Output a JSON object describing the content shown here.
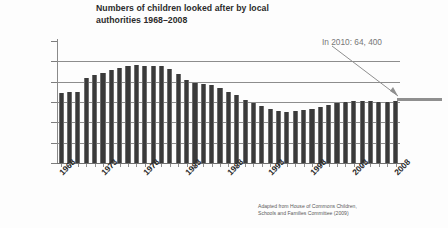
{
  "chart_data": {
    "type": "bar",
    "title": "Numbers of children looked after by local\nauthorities 1968–2008",
    "xlabel": "",
    "ylabel": "",
    "ylim": [
      0,
      120000
    ],
    "ytick_labels": [
      "120000",
      "100000",
      "80000",
      "60000",
      "40000",
      "20000",
      "0"
    ],
    "ytick_values": [
      120000,
      100000,
      80000,
      60000,
      40000,
      20000,
      0
    ],
    "grid": true,
    "legend": null,
    "x": [
      1968,
      1969,
      1970,
      1971,
      1972,
      1973,
      1974,
      1975,
      1976,
      1977,
      1978,
      1979,
      1980,
      1981,
      1982,
      1983,
      1984,
      1985,
      1986,
      1987,
      1988,
      1989,
      1990,
      1991,
      1992,
      1993,
      1994,
      1995,
      1996,
      1997,
      1998,
      1999,
      2000,
      2001,
      2002,
      2003,
      2004,
      2005,
      2006,
      2007,
      2008
    ],
    "xtick_labels": [
      "1968",
      "1973",
      "1978",
      "1983",
      "1988",
      "1993",
      "1998",
      "2003",
      "2008"
    ],
    "xtick_positions": [
      1968,
      1973,
      1978,
      1983,
      1988,
      1993,
      1998,
      2003,
      2008
    ],
    "values": [
      69000,
      69500,
      70000,
      84000,
      87000,
      89000,
      91000,
      93000,
      95500,
      96000,
      95500,
      95000,
      95000,
      92500,
      88000,
      82000,
      79000,
      77500,
      76500,
      73500,
      70000,
      66500,
      61500,
      59500,
      56000,
      53000,
      51000,
      50000,
      51000,
      52500,
      53500,
      55500,
      57500,
      59000,
      60500,
      61000,
      61000,
      61000,
      60500,
      60500,
      60900
    ],
    "annotations": [
      {
        "text": "In 2010: 64, 400",
        "value": 64400,
        "year": 2010,
        "marker_type": "horizontal-bar-with-leader-line"
      }
    ],
    "source_note": "Adapted from House of Commons Children,\nSchools and Families Committee (2009)",
    "colors": {
      "bar": "#3a3a3a",
      "gridline": "#8d8d8d",
      "axis": "#7d7d7d",
      "annotation": "#8f8f8f",
      "title_text": "#2b2b2b",
      "background": "#fdfdfd"
    }
  }
}
